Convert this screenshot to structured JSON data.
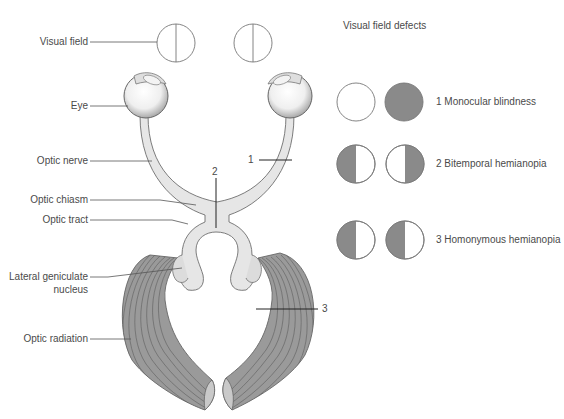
{
  "diagram": {
    "labels": {
      "visual_field": "Visual field",
      "eye": "Eye",
      "optic_nerve": "Optic nerve",
      "optic_chiasm": "Optic chiasm",
      "optic_tract": "Optic tract",
      "lgn_line1": "Lateral geniculate",
      "lgn_line2": "nucleus",
      "optic_radiation": "Optic radiation"
    },
    "lesion_markers": {
      "one": "1",
      "two": "2",
      "three": "3"
    },
    "defects": {
      "title": "Visual field defects",
      "items": [
        {
          "number": "1",
          "name": "Monocular blindness",
          "left_eye": "clear",
          "right_eye": "full-dark"
        },
        {
          "number": "2",
          "name": "Bitemporal hemianopia",
          "left_eye": "left-dark",
          "right_eye": "right-dark"
        },
        {
          "number": "3",
          "name": "Homonymous hemianopia",
          "left_eye": "left-dark",
          "right_eye": "left-dark"
        }
      ],
      "item_labels": [
        "1  Monocular blindness",
        "2  Bitemporal hemianopia",
        "3  Homonymous hemianopia"
      ]
    },
    "colors": {
      "stroke": "#6e6e6e",
      "defect_fill": "#8a8a8a",
      "nerve_fill": "#e6e6e6",
      "radiation_fill": "#9a9a9a",
      "radiation_light": "#c9c9c9",
      "leader": "#555555"
    }
  }
}
